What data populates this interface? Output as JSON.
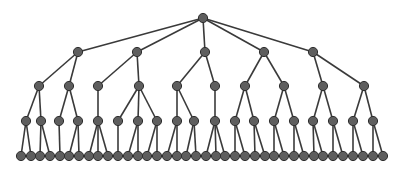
{
  "diagram": {
    "type": "tree",
    "colors": {
      "node_fill": "#5e5e5e",
      "node_stroke": "#2e2e2e",
      "edge": "#3a3a3a",
      "background": "#ffffff"
    },
    "node_radius": 4.6,
    "levels": [
      {
        "y": 18,
        "nodes": [
          {
            "id": "r",
            "x": 203
          }
        ]
      },
      {
        "y": 52,
        "nodes": [
          {
            "id": "a",
            "x": 78,
            "parent": "r"
          },
          {
            "id": "b",
            "x": 137,
            "parent": "r"
          },
          {
            "id": "c",
            "x": 205,
            "parent": "r"
          },
          {
            "id": "d",
            "x": 264,
            "parent": "r"
          },
          {
            "id": "e",
            "x": 313,
            "parent": "r"
          }
        ]
      },
      {
        "y": 86,
        "nodes": [
          {
            "id": "a1",
            "x": 39,
            "parent": "a"
          },
          {
            "id": "a2",
            "x": 69,
            "parent": "a"
          },
          {
            "id": "b1",
            "x": 98,
            "parent": "b"
          },
          {
            "id": "b2",
            "x": 139,
            "parent": "b"
          },
          {
            "id": "c1",
            "x": 177,
            "parent": "c"
          },
          {
            "id": "c2",
            "x": 215,
            "parent": "c"
          },
          {
            "id": "d1",
            "x": 245,
            "parent": "d"
          },
          {
            "id": "d2",
            "x": 284,
            "parent": "d"
          },
          {
            "id": "e1",
            "x": 323,
            "parent": "e"
          },
          {
            "id": "e2",
            "x": 364,
            "parent": "e"
          }
        ]
      },
      {
        "y": 121,
        "nodes": [
          {
            "id": "a1a",
            "x": 26,
            "parent": "a1"
          },
          {
            "id": "a1b",
            "x": 41,
            "parent": "a1"
          },
          {
            "id": "a2a",
            "x": 59,
            "parent": "a2"
          },
          {
            "id": "a2b",
            "x": 78,
            "parent": "a2"
          },
          {
            "id": "b1a",
            "x": 98,
            "parent": "b1"
          },
          {
            "id": "b2a",
            "x": 118,
            "parent": "b2"
          },
          {
            "id": "b2b",
            "x": 138,
            "parent": "b2"
          },
          {
            "id": "b2c",
            "x": 157,
            "parent": "b2"
          },
          {
            "id": "c1a",
            "x": 177,
            "parent": "c1"
          },
          {
            "id": "c1b",
            "x": 194,
            "parent": "c1"
          },
          {
            "id": "c2a",
            "x": 215,
            "parent": "c2"
          },
          {
            "id": "d1a",
            "x": 235,
            "parent": "d1"
          },
          {
            "id": "d1b",
            "x": 254,
            "parent": "d1"
          },
          {
            "id": "d2a",
            "x": 274,
            "parent": "d2"
          },
          {
            "id": "d2b",
            "x": 294,
            "parent": "d2"
          },
          {
            "id": "e1a",
            "x": 313,
            "parent": "e1"
          },
          {
            "id": "e1b",
            "x": 333,
            "parent": "e1"
          },
          {
            "id": "e2a",
            "x": 353,
            "parent": "e2"
          },
          {
            "id": "e2b",
            "x": 373,
            "parent": "e2"
          }
        ]
      },
      {
        "y": 156,
        "nodes": [
          {
            "x": 21,
            "parent": "a1a"
          },
          {
            "x": 31,
            "parent": "a1a"
          },
          {
            "x": 40,
            "parent": "a1b"
          },
          {
            "x": 50,
            "parent": "a1b"
          },
          {
            "x": 60,
            "parent": "a2a"
          },
          {
            "x": 69,
            "parent": "a2b"
          },
          {
            "x": 79,
            "parent": "a2b"
          },
          {
            "x": 89,
            "parent": "b1a"
          },
          {
            "x": 98,
            "parent": "b1a"
          },
          {
            "x": 108,
            "parent": "b1a"
          },
          {
            "x": 118,
            "parent": "b2a"
          },
          {
            "x": 128,
            "parent": "b2b"
          },
          {
            "x": 138,
            "parent": "b2b"
          },
          {
            "x": 147,
            "parent": "b2c"
          },
          {
            "x": 157,
            "parent": "b2c"
          },
          {
            "x": 167,
            "parent": "c1a"
          },
          {
            "x": 177,
            "parent": "c1a"
          },
          {
            "x": 186,
            "parent": "c1b"
          },
          {
            "x": 196,
            "parent": "c1b"
          },
          {
            "x": 206,
            "parent": "c2a"
          },
          {
            "x": 216,
            "parent": "c2a"
          },
          {
            "x": 225,
            "parent": "c2a"
          },
          {
            "x": 235,
            "parent": "d1a"
          },
          {
            "x": 245,
            "parent": "d1a"
          },
          {
            "x": 255,
            "parent": "d1b"
          },
          {
            "x": 265,
            "parent": "d1b"
          },
          {
            "x": 274,
            "parent": "d2a"
          },
          {
            "x": 284,
            "parent": "d2a"
          },
          {
            "x": 294,
            "parent": "d2b"
          },
          {
            "x": 304,
            "parent": "d2b"
          },
          {
            "x": 314,
            "parent": "e1a"
          },
          {
            "x": 323,
            "parent": "e1a"
          },
          {
            "x": 333,
            "parent": "e1b"
          },
          {
            "x": 343,
            "parent": "e1b"
          },
          {
            "x": 353,
            "parent": "e2a"
          },
          {
            "x": 363,
            "parent": "e2a"
          },
          {
            "x": 373,
            "parent": "e2b"
          },
          {
            "x": 383,
            "parent": "e2b"
          }
        ]
      }
    ]
  }
}
